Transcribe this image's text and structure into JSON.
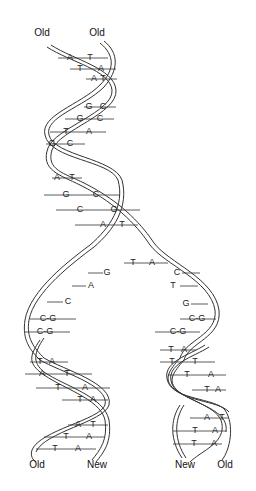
{
  "diagram": {
    "top_labels": [
      {
        "text": "Old",
        "x": 42,
        "y": 36
      },
      {
        "text": "Old",
        "x": 97,
        "y": 36
      }
    ],
    "bottom_labels": [
      {
        "text": "Old",
        "x": 37,
        "y": 468
      },
      {
        "text": "New",
        "x": 97,
        "y": 468
      },
      {
        "text": "New",
        "x": 185,
        "y": 468
      },
      {
        "text": "Old",
        "x": 225,
        "y": 468
      }
    ],
    "parent_pairs": [
      {
        "left": "A",
        "right": "T",
        "y": 58
      },
      {
        "left": "T",
        "right": "A",
        "y": 69
      },
      {
        "left": "A",
        "right": "T",
        "y": 79
      },
      {
        "left": "G",
        "right": "C",
        "y": 107
      },
      {
        "left": "G",
        "right": "C",
        "y": 119
      },
      {
        "left": "T",
        "right": "A",
        "y": 132
      },
      {
        "left": "G",
        "right": "C",
        "y": 144
      },
      {
        "left": "A",
        "right": "T",
        "y": 178
      },
      {
        "left": "G",
        "right": "C",
        "y": 195
      },
      {
        "left": "C",
        "right": "G",
        "y": 210
      },
      {
        "left": "A",
        "right": "T",
        "y": 225
      },
      {
        "left": "T",
        "right": "A",
        "y": 263
      }
    ],
    "left_fork_bases": [
      {
        "base": "G",
        "y": 273
      },
      {
        "base": "A",
        "y": 286
      },
      {
        "base": "C",
        "y": 302
      },
      {
        "pair": "C-G",
        "y": 319
      },
      {
        "pair": "C-G",
        "y": 332
      }
    ],
    "right_fork_bases": [
      {
        "base": "C",
        "y": 273
      },
      {
        "base": "T",
        "y": 286
      },
      {
        "base": "G",
        "y": 304
      },
      {
        "pair": "C-G",
        "y": 319
      },
      {
        "pair": "C-G",
        "y": 332
      }
    ],
    "left_daughter_pairs": [
      {
        "left": "T",
        "right": "A",
        "y": 362
      },
      {
        "left": "A",
        "right": "T",
        "y": 374
      },
      {
        "left": "T",
        "right": "A",
        "y": 388
      },
      {
        "left": "T",
        "right": "A",
        "y": 400
      },
      {
        "left": "A",
        "right": "T",
        "y": 425
      },
      {
        "left": "T",
        "right": "A",
        "y": 437
      },
      {
        "left": "T",
        "right": "A",
        "y": 449
      }
    ],
    "right_daughter_pairs": [
      {
        "left": "T",
        "right": "A",
        "y": 350
      },
      {
        "left": "A",
        "right": "T",
        "y": 362
      },
      {
        "left": "T",
        "right": "A",
        "y": 375
      },
      {
        "left": "T",
        "right": "A",
        "y": 390
      },
      {
        "left": "A",
        "right": "T",
        "y": 418
      },
      {
        "left": "T",
        "right": "A",
        "y": 431
      },
      {
        "left": "T",
        "right": "A",
        "y": 444
      }
    ],
    "colors": {
      "stroke": "#333333",
      "background": "#ffffff",
      "text": "#222222"
    }
  }
}
